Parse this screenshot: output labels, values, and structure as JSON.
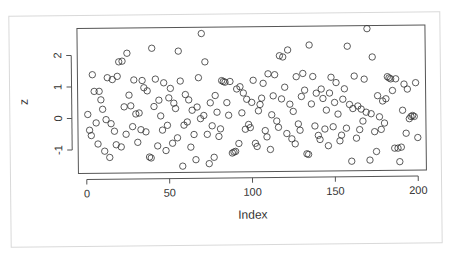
{
  "chart_data": {
    "type": "scatter",
    "title": "",
    "xlabel": "Index",
    "ylabel": "z",
    "xlim": [
      -5,
      205
    ],
    "ylim": [
      -1.75,
      2.85
    ],
    "x_ticks": [
      0,
      50,
      100,
      150,
      200
    ],
    "y_ticks": [
      -1,
      0,
      1,
      2
    ],
    "x_tick_labels": [
      "0",
      "50",
      "100",
      "150",
      "200"
    ],
    "y_tick_labels": [
      "-1",
      "0",
      "1",
      "2"
    ],
    "marker": "open-circle",
    "grid": false,
    "legend": null,
    "points": [
      [
        1,
        0.12
      ],
      [
        2,
        -0.38
      ],
      [
        3,
        -0.55
      ],
      [
        4,
        1.38
      ],
      [
        5,
        0.85
      ],
      [
        6,
        -0.15
      ],
      [
        7,
        -0.82
      ],
      [
        8,
        0.85
      ],
      [
        9,
        0.58
      ],
      [
        10,
        0.28
      ],
      [
        11,
        -1.05
      ],
      [
        12,
        -0.05
      ],
      [
        13,
        1.28
      ],
      [
        14,
        -1.25
      ],
      [
        15,
        -0.18
      ],
      [
        16,
        1.22
      ],
      [
        17,
        -0.42
      ],
      [
        18,
        -0.85
      ],
      [
        19,
        1.32
      ],
      [
        20,
        1.78
      ],
      [
        21,
        -0.92
      ],
      [
        22,
        1.8
      ],
      [
        23,
        0.35
      ],
      [
        24,
        -0.52
      ],
      [
        25,
        2.05
      ],
      [
        26,
        0.72
      ],
      [
        27,
        0.38
      ],
      [
        28,
        -0.28
      ],
      [
        29,
        1.2
      ],
      [
        30,
        0.12
      ],
      [
        31,
        -0.78
      ],
      [
        32,
        0.15
      ],
      [
        33,
        -0.38
      ],
      [
        34,
        1.18
      ],
      [
        35,
        0.95
      ],
      [
        36,
        -0.45
      ],
      [
        37,
        0.85
      ],
      [
        38,
        -1.25
      ],
      [
        39,
        -1.28
      ],
      [
        40,
        2.2
      ],
      [
        41,
        0.35
      ],
      [
        42,
        1.22
      ],
      [
        43,
        -0.9
      ],
      [
        44,
        0.55
      ],
      [
        45,
        0.05
      ],
      [
        46,
        -0.4
      ],
      [
        47,
        1.1
      ],
      [
        48,
        -1.05
      ],
      [
        49,
        -0.25
      ],
      [
        50,
        0.62
      ],
      [
        51,
        0.92
      ],
      [
        52,
        -0.82
      ],
      [
        53,
        0.45
      ],
      [
        54,
        0.28
      ],
      [
        55,
        -0.65
      ],
      [
        56,
        2.1
      ],
      [
        57,
        1.15
      ],
      [
        58,
        -1.55
      ],
      [
        59,
        -0.25
      ],
      [
        60,
        0.72
      ],
      [
        61,
        -0.15
      ],
      [
        62,
        0.55
      ],
      [
        63,
        -0.95
      ],
      [
        64,
        0.22
      ],
      [
        65,
        -0.55
      ],
      [
        66,
        -1.35
      ],
      [
        67,
        0.32
      ],
      [
        68,
        1.25
      ],
      [
        69,
        -0.05
      ],
      [
        70,
        2.65
      ],
      [
        71,
        0.05
      ],
      [
        72,
        1.75
      ],
      [
        73,
        -0.55
      ],
      [
        74,
        -1.48
      ],
      [
        75,
        0.45
      ],
      [
        76,
        -0.28
      ],
      [
        77,
        -1.28
      ],
      [
        78,
        0.68
      ],
      [
        79,
        0.15
      ],
      [
        80,
        -0.62
      ],
      [
        81,
        -0.38
      ],
      [
        82,
        1.15
      ],
      [
        83,
        1.12
      ],
      [
        84,
        1.1
      ],
      [
        85,
        0.45
      ],
      [
        86,
        0.05
      ],
      [
        87,
        1.12
      ],
      [
        88,
        -1.15
      ],
      [
        89,
        -1.12
      ],
      [
        90,
        -1.1
      ],
      [
        91,
        0.88
      ],
      [
        92,
        -0.85
      ],
      [
        93,
        0.95
      ],
      [
        94,
        0.12
      ],
      [
        95,
        0.75
      ],
      [
        96,
        -0.4
      ],
      [
        97,
        0.55
      ],
      [
        98,
        -0.25
      ],
      [
        99,
        -0.35
      ],
      [
        100,
        0.45
      ],
      [
        101,
        1.15
      ],
      [
        102,
        -0.85
      ],
      [
        103,
        -0.95
      ],
      [
        104,
        0.18
      ],
      [
        105,
        0.38
      ],
      [
        106,
        0.58
      ],
      [
        107,
        1.05
      ],
      [
        108,
        -0.45
      ],
      [
        109,
        -0.65
      ],
      [
        110,
        1.35
      ],
      [
        111,
        -1.05
      ],
      [
        112,
        0.05
      ],
      [
        113,
        0.65
      ],
      [
        114,
        1.32
      ],
      [
        115,
        -0.15
      ],
      [
        116,
        -0.35
      ],
      [
        117,
        1.92
      ],
      [
        118,
        0.55
      ],
      [
        119,
        1.88
      ],
      [
        120,
        0.92
      ],
      [
        121,
        -0.55
      ],
      [
        122,
        2.1
      ],
      [
        123,
        0.38
      ],
      [
        124,
        -0.72
      ],
      [
        125,
        0.15
      ],
      [
        126,
        -0.88
      ],
      [
        127,
        1.25
      ],
      [
        128,
        -0.25
      ],
      [
        129,
        -0.45
      ],
      [
        130,
        0.62
      ],
      [
        131,
        1.35
      ],
      [
        132,
        0.82
      ],
      [
        133,
        -1.2
      ],
      [
        134,
        -1.22
      ],
      [
        135,
        2.25
      ],
      [
        136,
        0.38
      ],
      [
        137,
        1.25
      ],
      [
        138,
        -0.32
      ],
      [
        139,
        0.72
      ],
      [
        140,
        -0.62
      ],
      [
        141,
        -0.75
      ],
      [
        142,
        0.85
      ],
      [
        143,
        0.55
      ],
      [
        144,
        -0.42
      ],
      [
        145,
        0.18
      ],
      [
        146,
        -0.95
      ],
      [
        147,
        0.72
      ],
      [
        148,
        1.22
      ],
      [
        149,
        -0.35
      ],
      [
        150,
        0.42
      ],
      [
        151,
        1.05
      ],
      [
        152,
        0.05
      ],
      [
        153,
        -0.8
      ],
      [
        154,
        -0.62
      ],
      [
        155,
        0.52
      ],
      [
        156,
        0.85
      ],
      [
        157,
        -0.4
      ],
      [
        158,
        2.2
      ],
      [
        159,
        0.35
      ],
      [
        160,
        -1.45
      ],
      [
        161,
        0.22
      ],
      [
        162,
        1.25
      ],
      [
        163,
        -0.72
      ],
      [
        164,
        0.3
      ],
      [
        165,
        -0.45
      ],
      [
        166,
        0.2
      ],
      [
        167,
        -0.18
      ],
      [
        168,
        1.15
      ],
      [
        169,
        0.1
      ],
      [
        170,
        2.75
      ],
      [
        171,
        -1.42
      ],
      [
        172,
        0.05
      ],
      [
        173,
        1.85
      ],
      [
        174,
        -0.52
      ],
      [
        175,
        -1.15
      ],
      [
        176,
        0.62
      ],
      [
        177,
        -0.05
      ],
      [
        178,
        -0.45
      ],
      [
        179,
        0.45
      ],
      [
        180,
        -0.25
      ],
      [
        181,
        0.52
      ],
      [
        182,
        1.22
      ],
      [
        183,
        1.18
      ],
      [
        184,
        1.15
      ],
      [
        185,
        0.78
      ],
      [
        186,
        -1.05
      ],
      [
        187,
        1.15
      ],
      [
        188,
        -1.05
      ],
      [
        189,
        -1.48
      ],
      [
        190,
        -1.02
      ],
      [
        191,
        0.15
      ],
      [
        192,
        0.98
      ],
      [
        193,
        -0.58
      ],
      [
        194,
        0.82
      ],
      [
        195,
        -0.12
      ],
      [
        196,
        -0.05
      ],
      [
        197,
        -0.02
      ],
      [
        198,
        -0.05
      ],
      [
        199,
        1.02
      ],
      [
        200,
        -0.72
      ]
    ]
  },
  "colors": {
    "background": "#ffffff",
    "paper": "#ffffff",
    "paper_border": "#d9d9d9",
    "axis": "#555555",
    "marker": "#333333",
    "text": "#333333"
  }
}
